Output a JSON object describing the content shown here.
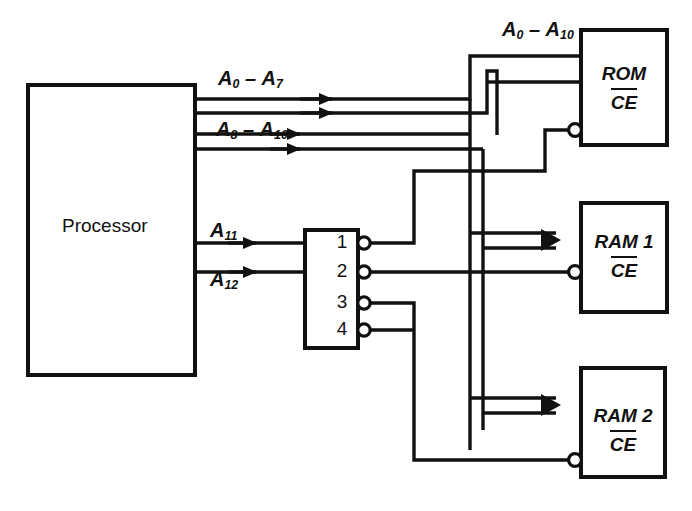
{
  "diagram": {
    "background_color": "#ffffff",
    "line_color": "#111111"
  },
  "blocks": {
    "processor": {
      "label": "Processor",
      "x": 28,
      "y": 85,
      "w": 167,
      "h": 290
    },
    "decoder": {
      "label": "",
      "x": 305,
      "y": 230,
      "w": 53,
      "h": 118,
      "outputs": [
        {
          "number": "1"
        },
        {
          "number": "2"
        },
        {
          "number": "3"
        },
        {
          "number": "4"
        }
      ]
    },
    "rom": {
      "name": "ROM",
      "enable": "CE",
      "x": 581,
      "y": 30,
      "w": 86,
      "h": 115
    },
    "ram1": {
      "name": "RAM 1",
      "enable": "CE",
      "x": 581,
      "y": 203,
      "w": 86,
      "h": 109
    },
    "ram2": {
      "name": "RAM 2",
      "enable": "CE",
      "x": 581,
      "y": 368,
      "w": 84,
      "h": 109
    }
  },
  "bus_labels": {
    "a0_a7": {
      "base_a": "A",
      "sub_a": "0",
      "dash": "–",
      "base_b": "A",
      "sub_b": "7",
      "x": 218,
      "y": 70
    },
    "a8_a10": {
      "base_a": "A",
      "sub_a": "8",
      "dash": "–",
      "base_b": "A",
      "sub_b": "10",
      "x": 216,
      "y": 121
    },
    "a0_a10": {
      "base_a": "A",
      "sub_a": "0",
      "dash": "–",
      "base_b": "A",
      "sub_b": "10",
      "x": 502,
      "y": 21
    },
    "a11": {
      "base_a": "A",
      "sub_a": "11",
      "x": 210,
      "y": 222
    },
    "a12": {
      "base_a": "A",
      "sub_a": "12",
      "x": 210,
      "y": 271
    }
  },
  "signals": {
    "address_bus_low": "A0 – A7",
    "address_bus_mid": "A8 – A10",
    "address_bus_combined": "A0 – A10",
    "decode_line_1": "A11",
    "decode_line_2": "A12",
    "chip_enable": "CE"
  }
}
